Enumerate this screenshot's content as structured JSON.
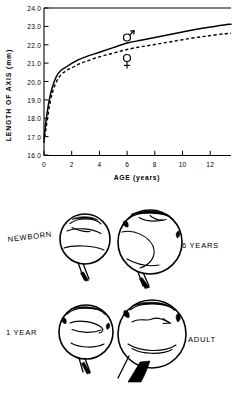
{
  "figure": {
    "caption_present": false
  },
  "chart_data": {
    "type": "line",
    "title": "",
    "xlabel": "AGE (years)",
    "ylabel": "LENGTH OF AXIS (mm)",
    "xlim": [
      0,
      13.5
    ],
    "ylim": [
      16.0,
      24.0
    ],
    "xticks": [
      0,
      2,
      4,
      6,
      8,
      10,
      12
    ],
    "xticklabels": [
      "0",
      "2",
      "4",
      "6",
      "8",
      "10",
      "12"
    ],
    "yticks": [
      16.0,
      17.0,
      18.0,
      19.0,
      20.0,
      21.0,
      22.0,
      23.0,
      24.0
    ],
    "yticklabels": [
      "16.0",
      "17.0",
      "18.0",
      "19.0",
      "20.0",
      "21.0",
      "22.0",
      "23.0",
      "24.0"
    ],
    "grid": false,
    "legend_position": "inline-annotation",
    "annotations": [
      {
        "name": "male-symbol",
        "text": "♂",
        "x": 6.0,
        "y": 22.55
      },
      {
        "name": "female-symbol",
        "text": "♀",
        "x": 6.0,
        "y": 21.35
      }
    ],
    "series": [
      {
        "name": "Male",
        "symbol": "♂",
        "style": "solid",
        "x": [
          0.0,
          0.15,
          0.35,
          0.6,
          0.9,
          1.2,
          1.6,
          2.0,
          2.5,
          3.0,
          4.0,
          5.0,
          6.0,
          7.0,
          8.0,
          9.0,
          10.0,
          11.0,
          12.0,
          13.0,
          13.5
        ],
        "values": [
          16.9,
          17.9,
          18.9,
          19.7,
          20.3,
          20.6,
          20.8,
          21.0,
          21.2,
          21.35,
          21.6,
          21.85,
          22.1,
          22.25,
          22.4,
          22.55,
          22.7,
          22.85,
          22.97,
          23.08,
          23.12
        ]
      },
      {
        "name": "Female",
        "symbol": "♀",
        "style": "dashed",
        "x": [
          0.0,
          0.15,
          0.35,
          0.6,
          0.9,
          1.2,
          1.6,
          2.0,
          2.5,
          3.0,
          4.0,
          5.0,
          6.0,
          7.0,
          8.0,
          9.0,
          10.0,
          11.0,
          12.0,
          13.0,
          13.5
        ],
        "values": [
          16.7,
          17.5,
          18.5,
          19.4,
          20.0,
          20.35,
          20.6,
          20.75,
          20.95,
          21.1,
          21.35,
          21.55,
          21.75,
          21.9,
          22.02,
          22.15,
          22.28,
          22.4,
          22.5,
          22.6,
          22.63
        ]
      }
    ]
  },
  "eye_diagrams": {
    "title": "",
    "items": [
      {
        "id": "newborn",
        "label": "NEWBORN",
        "label_side": "left",
        "relative_size": "smallest"
      },
      {
        "id": "six-years",
        "label": "6 YEARS",
        "label_side": "right",
        "relative_size": "large"
      },
      {
        "id": "one-year",
        "label": "1 YEAR",
        "label_side": "left",
        "relative_size": "small"
      },
      {
        "id": "adult",
        "label": "ADULT",
        "label_side": "right",
        "relative_size": "largest"
      }
    ]
  },
  "colors": {
    "ink": "#000000",
    "paper": "#ffffff"
  }
}
